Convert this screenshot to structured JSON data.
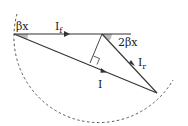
{
  "diagram": {
    "labels": {
      "beta_x": "βx",
      "I_f": "I",
      "I_f_sub": "f",
      "two_beta_x": "2βx",
      "I_r": "I",
      "I_r_sub": "r",
      "I": "I"
    },
    "colors": {
      "line": "#333333",
      "dashed": "#555555",
      "angle_fill": "#bbbbbb"
    }
  }
}
